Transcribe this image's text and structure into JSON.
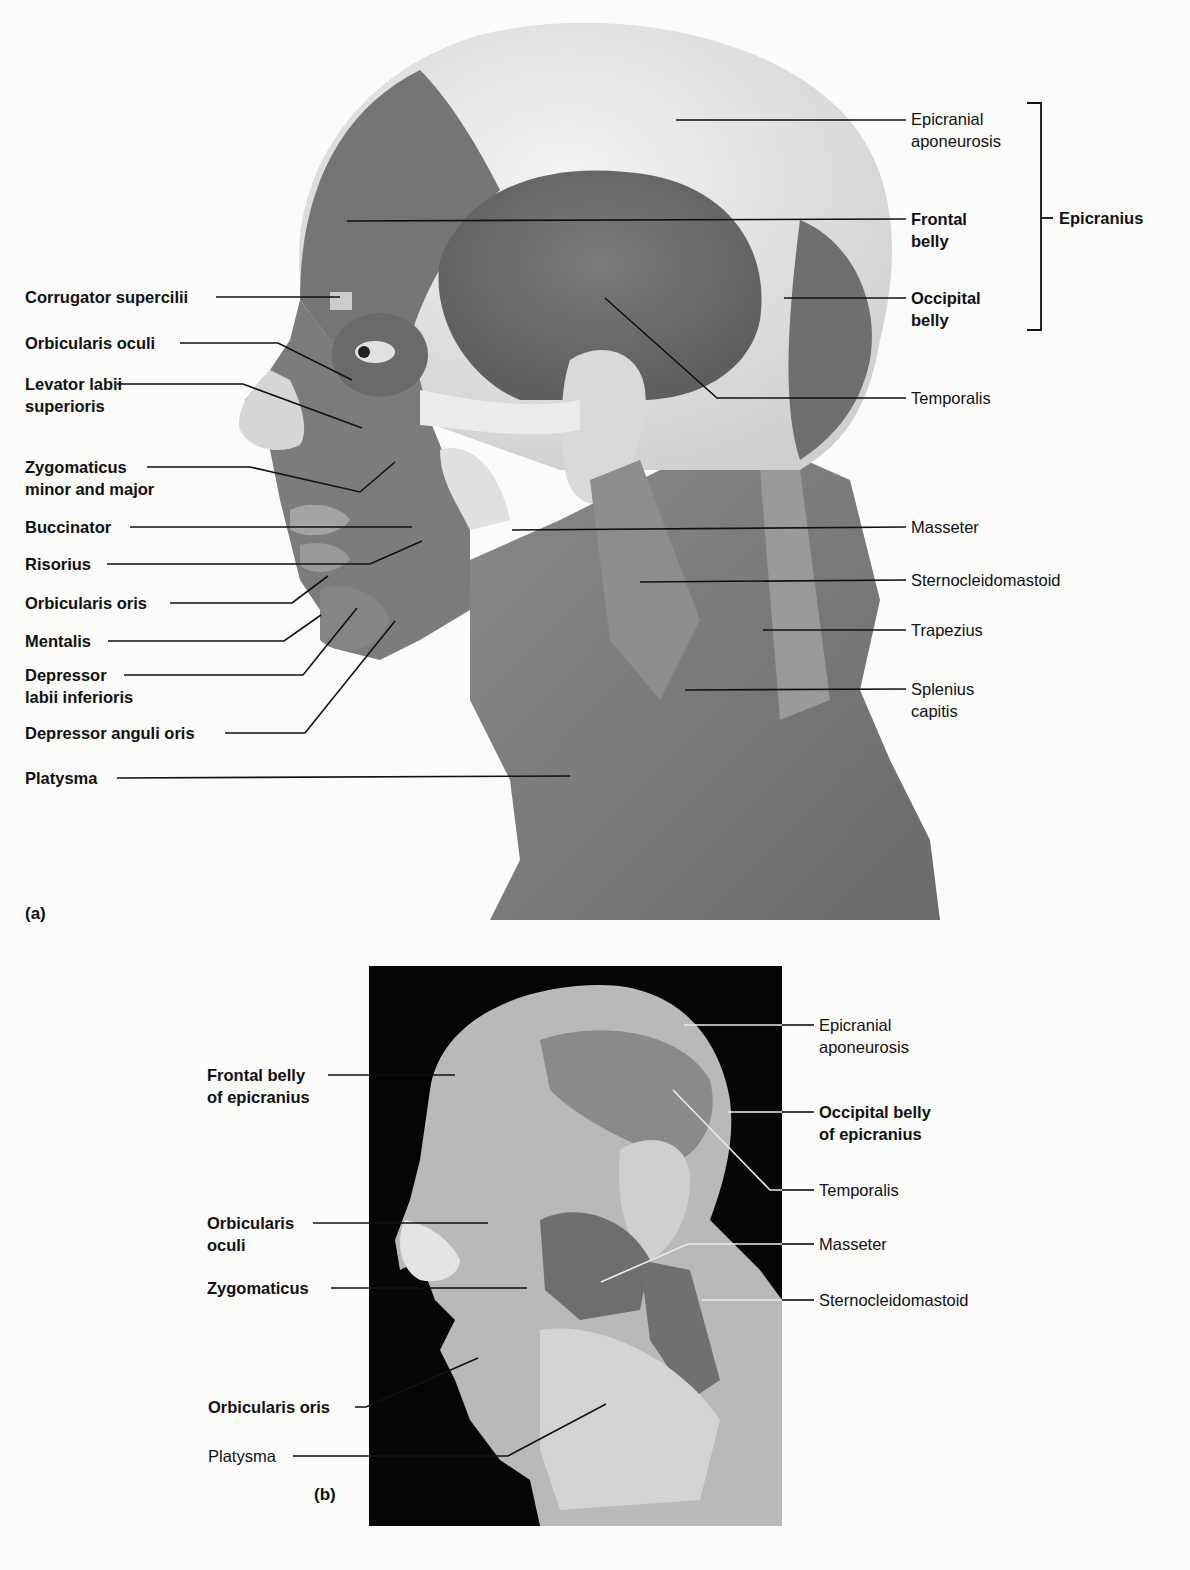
{
  "figure": {
    "panel_a": {
      "tag": "(a)",
      "left_labels": [
        {
          "line1": "Corrugator supercilii",
          "line2": ""
        },
        {
          "line1": "Orbicularis oculi",
          "line2": ""
        },
        {
          "line1": "Levator labii",
          "line2": "superioris"
        },
        {
          "line1": "Zygomaticus",
          "line2": "minor and major"
        },
        {
          "line1": "Buccinator",
          "line2": ""
        },
        {
          "line1": "Risorius",
          "line2": ""
        },
        {
          "line1": "Orbicularis oris",
          "line2": ""
        },
        {
          "line1": "Mentalis",
          "line2": ""
        },
        {
          "line1": "Depressor",
          "line2": "labii inferioris"
        },
        {
          "line1": "Depressor anguli oris",
          "line2": ""
        },
        {
          "line1": "Platysma",
          "line2": ""
        }
      ],
      "right_labels": [
        {
          "line1": "Epicranial",
          "line2": "aponeurosis"
        },
        {
          "line1": "Frontal",
          "line2": "belly"
        },
        {
          "line1": "Occipital",
          "line2": "belly"
        },
        {
          "line1": "Temporalis",
          "line2": ""
        },
        {
          "line1": "Masseter",
          "line2": ""
        },
        {
          "line1": "Sternocleidomastoid",
          "line2": ""
        },
        {
          "line1": "Trapezius",
          "line2": ""
        },
        {
          "line1": "Splenius",
          "line2": "capitis"
        }
      ],
      "bracket_label": "Epicranius"
    },
    "panel_b": {
      "tag": "(b)",
      "left_labels": [
        {
          "line1": "Frontal belly",
          "line2": "of epicranius"
        },
        {
          "line1": "Orbicularis",
          "line2": "oculi"
        },
        {
          "line1": "Zygomaticus",
          "line2": ""
        },
        {
          "line1": "Orbicularis oris",
          "line2": ""
        },
        {
          "line1": "Platysma",
          "line2": ""
        }
      ],
      "right_labels": [
        {
          "line1": "Epicranial",
          "line2": "aponeurosis"
        },
        {
          "line1": "Occipital belly",
          "line2": "of epicranius"
        },
        {
          "line1": "Temporalis",
          "line2": ""
        },
        {
          "line1": "Masseter",
          "line2": ""
        },
        {
          "line1": "Sternocleidomastoid",
          "line2": ""
        }
      ]
    },
    "colors": {
      "background": "#fbfbfa",
      "muscle_dark": "#6e6e6e",
      "muscle_mid": "#8c8c8c",
      "tendon_light": "#e6e6e6",
      "photo_background": "#050505",
      "leader_line": "#111111"
    }
  }
}
